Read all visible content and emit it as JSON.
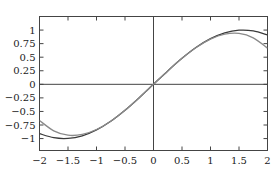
{
  "chart_data": {
    "type": "line",
    "title": "",
    "xlabel": "",
    "ylabel": "",
    "xlim": [
      -2,
      2
    ],
    "ylim": [
      -1.22,
      1.25
    ],
    "grid": false,
    "legend": null,
    "axes_through_origin": true,
    "x_ticks": [
      -2,
      -1.5,
      -1,
      -0.5,
      0,
      0.5,
      1,
      1.5,
      2
    ],
    "x_tick_labels": [
      "−2",
      "−1.5",
      "−1",
      "−0.5",
      "0",
      "0.5",
      "1",
      "1.5",
      "2"
    ],
    "y_ticks": [
      1,
      0.75,
      0.5,
      0.25,
      0,
      -0.25,
      -0.5,
      -0.75,
      -1
    ],
    "y_tick_labels": [
      "1",
      "0.75",
      "0.5",
      "0.25",
      "0",
      "−0.25",
      "−0.5",
      "−0.75",
      "−1"
    ],
    "series": [
      {
        "name": "sin(x)",
        "color": "#3a3a3a",
        "x": [
          -2,
          -1.75,
          -1.5,
          -1.25,
          -1,
          -0.75,
          -0.5,
          -0.25,
          0,
          0.25,
          0.5,
          0.75,
          1,
          1.25,
          1.5,
          1.75,
          2
        ],
        "values": [
          -0.909,
          -0.984,
          -0.997,
          -0.949,
          -0.841,
          -0.682,
          -0.479,
          -0.247,
          0,
          0.247,
          0.479,
          0.682,
          0.841,
          0.949,
          0.997,
          0.984,
          0.909
        ]
      },
      {
        "name": "x - x^3/6",
        "color": "#8a8a8a",
        "x": [
          -2,
          -1.75,
          -1.5,
          -1.25,
          -1,
          -0.75,
          -0.5,
          -0.25,
          0,
          0.25,
          0.5,
          0.75,
          1,
          1.25,
          1.5,
          1.75,
          2
        ],
        "values": [
          -0.667,
          -0.857,
          -0.938,
          -0.924,
          -0.833,
          -0.68,
          -0.479,
          -0.247,
          0,
          0.247,
          0.479,
          0.68,
          0.833,
          0.924,
          0.938,
          0.857,
          0.667
        ]
      }
    ]
  }
}
